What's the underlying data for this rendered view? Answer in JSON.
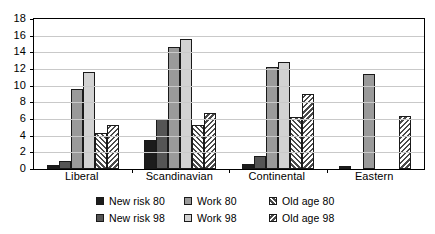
{
  "chart_data": {
    "type": "bar",
    "title": "",
    "xlabel": "",
    "ylabel": "",
    "ylim": [
      0,
      18
    ],
    "y_ticks": [
      0,
      2,
      4,
      6,
      8,
      10,
      12,
      14,
      16,
      18
    ],
    "grid": true,
    "legend_position": "bottom",
    "categories": [
      "Liberal",
      "Scandinavian",
      "Continental",
      "Eastern"
    ],
    "series": [
      {
        "name": "New risk 80",
        "key": "newrisk80",
        "color": "#1c1c1c",
        "pattern": "solid",
        "values": [
          0.5,
          3.5,
          0.6,
          0.4
        ]
      },
      {
        "name": "New risk 98",
        "key": "newrisk98",
        "color": "#555555",
        "pattern": "solid",
        "values": [
          1.0,
          6.0,
          1.6,
          0.0
        ]
      },
      {
        "name": "Work 80",
        "key": "work80",
        "color": "#9a9a9a",
        "pattern": "solid",
        "values": [
          9.6,
          14.6,
          12.2,
          11.4
        ]
      },
      {
        "name": "Work 98",
        "key": "work98",
        "color": "#d2d2d2",
        "pattern": "solid",
        "values": [
          11.6,
          15.6,
          12.9,
          0.0
        ]
      },
      {
        "name": "Old age 80",
        "key": "oldage80",
        "color": "#4a4a4a",
        "pattern": "hatch-right",
        "values": [
          4.3,
          5.3,
          6.3,
          0.0
        ]
      },
      {
        "name": "Old age 98",
        "key": "oldage98",
        "color": "#4a4a4a",
        "pattern": "hatch-left",
        "values": [
          5.3,
          6.7,
          9.0,
          6.4
        ]
      }
    ]
  },
  "legend": {
    "items": [
      {
        "label": "New risk 80",
        "key": "newrisk80"
      },
      {
        "label": "Work 80",
        "key": "work80"
      },
      {
        "label": "Old age 80",
        "key": "oldage80"
      },
      {
        "label": "New risk 98",
        "key": "newrisk98"
      },
      {
        "label": "Work 98",
        "key": "work98"
      },
      {
        "label": "Old age 98",
        "key": "oldage98"
      }
    ]
  }
}
